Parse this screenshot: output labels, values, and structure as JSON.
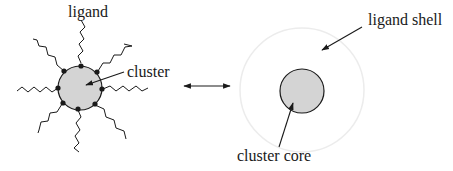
{
  "diagram": {
    "left": {
      "ligand_label": "ligand",
      "cluster_label": "cluster"
    },
    "right": {
      "ligand_shell_label": "ligand shell",
      "cluster_core_label": "cluster core"
    },
    "connector": "double-arrow",
    "colors": {
      "core_fill": "#d4d4d4",
      "stroke": "#1a1a1a",
      "shell": "#eeeeee"
    }
  }
}
